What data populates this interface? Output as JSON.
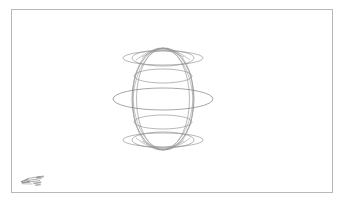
{
  "document": {
    "title": "Wireframe Sphere Drawing",
    "background_color": "#ffffff",
    "border_color": "#b8b8b8",
    "stroke_color": "#8b8b8b"
  },
  "frame": {
    "name": "drawing-canvas-frame",
    "x": 11,
    "y": 9,
    "width": 322,
    "height": 184
  },
  "figure": {
    "name": "wireframe-sphere",
    "center_x": 163,
    "center_y": 99,
    "outline_rx": 31,
    "outline_ry": 51,
    "equator_rx": 50,
    "equator_ry": 11,
    "latitudes": [
      {
        "label": "north-polar-ring",
        "cy": 58,
        "rx": 31,
        "ry": 8
      },
      {
        "label": "upper-mid-ring",
        "cy": 76,
        "rx": 29,
        "ry": 7
      },
      {
        "label": "equator-ring",
        "cy": 99,
        "rx": 50,
        "ry": 11
      },
      {
        "label": "lower-mid-ring",
        "cy": 122,
        "rx": 29,
        "ry": 7
      },
      {
        "label": "south-polar-ring",
        "cy": 140,
        "rx": 31,
        "ry": 8
      }
    ],
    "pole_caps": [
      {
        "label": "top-cap-ellipse",
        "cy": 58,
        "rx": 40,
        "ry": 7
      },
      {
        "label": "bottom-cap-ellipse",
        "cy": 140,
        "rx": 40,
        "ry": 7
      }
    ],
    "meridians": [
      {
        "label": "meridian-front",
        "rx": 31,
        "ry": 51
      },
      {
        "label": "meridian-offset",
        "rx": 27,
        "ry": 51
      }
    ]
  },
  "logo": {
    "name": "corner-logo-mark",
    "x": 19,
    "y": 173,
    "width": 30,
    "height": 18
  }
}
